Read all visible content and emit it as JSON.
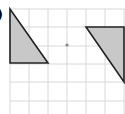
{
  "figure": {
    "label_fragment": ")",
    "grid": {
      "x_lines": [
        10,
        29,
        48,
        67,
        86,
        105,
        124
      ],
      "y_lines": [
        9,
        27,
        46,
        64,
        82,
        101
      ],
      "color": "#d8d8d8"
    },
    "center_point": {
      "x": 67,
      "y": 45,
      "color": "#888888"
    },
    "shapes": [
      {
        "name": "left-triangle",
        "points": "10,9 10,63 48,63",
        "fill": "#c8c8c8",
        "stroke": "#222222"
      },
      {
        "name": "right-triangle",
        "points": "86,27 124,27 124,82",
        "fill": "#c8c8c8",
        "stroke": "#222222"
      }
    ]
  }
}
